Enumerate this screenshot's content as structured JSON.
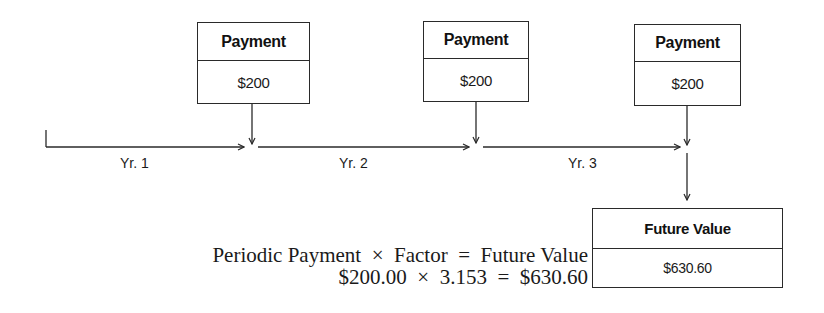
{
  "diagram": {
    "type": "future-value-of-annuity-timeline",
    "payments": [
      {
        "header": "Payment",
        "amount": "$200"
      },
      {
        "header": "Payment",
        "amount": "$200"
      },
      {
        "header": "Payment",
        "amount": "$200"
      }
    ],
    "periods": [
      "Yr. 1",
      "Yr. 2",
      "Yr. 3"
    ],
    "result": {
      "header": "Future Value",
      "amount": "$630.60"
    },
    "equation": {
      "line1": "Periodic Payment  ×  Factor  =  Future Value",
      "line2": "$200.00  ×  3.153  =  $630.60"
    }
  }
}
